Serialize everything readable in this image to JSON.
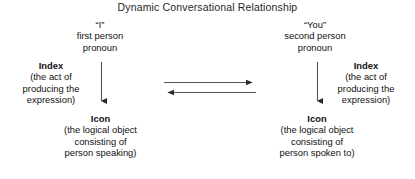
{
  "title": "Dynamic Conversational Relationship",
  "left": {
    "pronoun": {
      "term": "“I”",
      "line2": "first person",
      "line3": "pronoun"
    },
    "index": {
      "heading": "Index",
      "line2": "(the act of",
      "line3": "producing the",
      "line4": "expression)"
    },
    "icon": {
      "heading": "Icon",
      "line2": "(the logical object",
      "line3": "consisting of",
      "line4": "person speaking)"
    }
  },
  "right": {
    "pronoun": {
      "term": "“You”",
      "line2": "second person",
      "line3": "pronoun"
    },
    "index": {
      "heading": "Index",
      "line2": "(the act of",
      "line3": "producing the",
      "line4": "expression)"
    },
    "icon": {
      "heading": "Icon",
      "line2": "(the logical object",
      "line3": "consisting of",
      "line4": "person spoken to)"
    }
  },
  "arrows": {
    "color": "#333333",
    "left_vertical": "arrow-down-left",
    "right_vertical": "arrow-down-right",
    "middle_top": "arrow-right",
    "middle_bottom": "arrow-left"
  }
}
